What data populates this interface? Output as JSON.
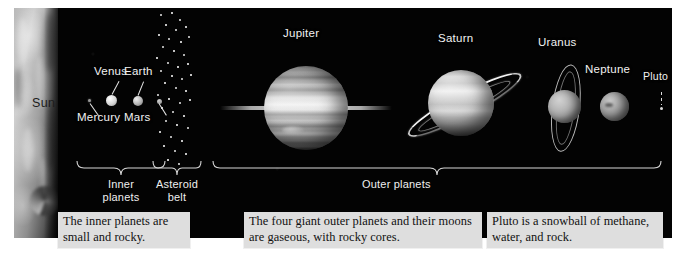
{
  "figure": {
    "background_color": "#ffffff",
    "panel_color": "#030303"
  },
  "star": {
    "label": "Sun",
    "label_color": "#1c1c1c"
  },
  "planets": [
    {
      "name": "Mercury",
      "label": "Mercury",
      "label_position": "below-left",
      "group": "inner"
    },
    {
      "name": "Venus",
      "label": "Venus",
      "label_position": "above",
      "group": "inner"
    },
    {
      "name": "Earth",
      "label": "Earth",
      "label_position": "above",
      "group": "inner"
    },
    {
      "name": "Mars",
      "label": "Mars",
      "label_position": "below-right",
      "group": "inner"
    },
    {
      "name": "Jupiter",
      "label": "Jupiter",
      "label_position": "above",
      "group": "outer",
      "rings": true
    },
    {
      "name": "Saturn",
      "label": "Saturn",
      "label_position": "above",
      "group": "outer",
      "rings": true
    },
    {
      "name": "Uranus",
      "label": "Uranus",
      "label_position": "above",
      "group": "outer",
      "rings": true
    },
    {
      "name": "Neptune",
      "label": "Neptune",
      "label_position": "above",
      "group": "outer",
      "rings": false
    },
    {
      "name": "Pluto",
      "label": "Pluto",
      "label_position": "above",
      "group": "outer",
      "rings": false
    }
  ],
  "groups": {
    "inner": {
      "label_line1": "Inner",
      "label_line2": "planets"
    },
    "belt": {
      "label_line1": "Asteroid",
      "label_line2": "belt"
    },
    "outer": {
      "label": "Outer planets"
    }
  },
  "captions": [
    {
      "id": "inner-caption",
      "text": "The inner planets are small and rocky."
    },
    {
      "id": "outer-caption",
      "text": "The four giant outer planets and their moons are gaseous, with rocky cores."
    },
    {
      "id": "pluto-caption",
      "text": "Pluto is a snowball of methane, water, and rock."
    }
  ],
  "colors": {
    "label_text": "#f2f2f2",
    "caption_background": "#dedede",
    "caption_text": "#111111",
    "bracket": "#d8d8d8"
  }
}
